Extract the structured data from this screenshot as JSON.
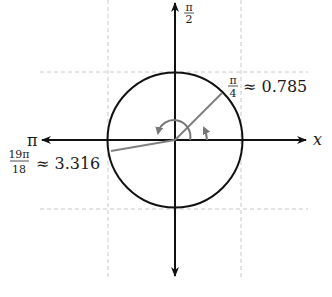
{
  "diagram": {
    "type": "unit-circle-angles",
    "axes": {
      "x_label": "x",
      "positive_y_label_num": "π",
      "positive_y_label_den": "2",
      "negative_x_label": "π"
    },
    "angles": [
      {
        "name": "pi-over-4",
        "label_num": "π",
        "label_den": "4",
        "approx": "≈ 0.785",
        "radians": 0.785
      },
      {
        "name": "19pi-over-18",
        "label_num": "19π",
        "label_den": "18",
        "approx": "≈ 3.316",
        "radians": 3.316
      }
    ],
    "colors": {
      "axis": "#111111",
      "circle": "#111111",
      "ray": "#808080",
      "grid": "#c8c8c8"
    }
  }
}
